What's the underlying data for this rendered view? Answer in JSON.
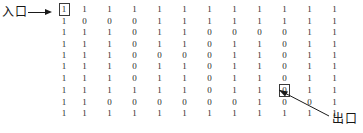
{
  "figure": {
    "type": "maze-matrix-diagram"
  },
  "annotations": {
    "entrance": {
      "label": "入口",
      "arrow": "arrow-right",
      "target_row": 1,
      "target_col": 1,
      "target_value": "1"
    },
    "exit": {
      "label": "出口",
      "arrow": "arrow-up-left",
      "target_row": 8,
      "target_col": 10,
      "target_value": "0"
    }
  },
  "matrix": {
    "rows": 10,
    "cols": 12,
    "marked_cells": [
      {
        "row": 0,
        "col": 0
      },
      {
        "row": 7,
        "col": 9
      }
    ],
    "values": [
      [
        "1",
        "1",
        "1",
        "1",
        "1",
        "1",
        "1",
        "1",
        "1",
        "1",
        "1",
        "1"
      ],
      [
        "1",
        "0",
        "0",
        "0",
        "1",
        "1",
        "1",
        "1",
        "1",
        "1",
        "1",
        "1"
      ],
      [
        "1",
        "1",
        "1",
        "0",
        "1",
        "1",
        "0",
        "0",
        "0",
        "0",
        "1",
        "1"
      ],
      [
        "1",
        "1",
        "1",
        "0",
        "1",
        "1",
        "0",
        "1",
        "1",
        "0",
        "1",
        "1"
      ],
      [
        "1",
        "1",
        "1",
        "0",
        "0",
        "0",
        "0",
        "1",
        "1",
        "0",
        "1",
        "1"
      ],
      [
        "1",
        "1",
        "1",
        "0",
        "1",
        "1",
        "0",
        "1",
        "1",
        "0",
        "1",
        "1"
      ],
      [
        "1",
        "1",
        "1",
        "0",
        "1",
        "1",
        "0",
        "1",
        "1",
        "0",
        "1",
        "1"
      ],
      [
        "1",
        "1",
        "1",
        "1",
        "1",
        "1",
        "0",
        "1",
        "1",
        "0",
        "1",
        "1"
      ],
      [
        "1",
        "1",
        "0",
        "0",
        "0",
        "0",
        "0",
        "0",
        "1",
        "0",
        "0",
        "1"
      ],
      [
        "1",
        "1",
        "1",
        "1",
        "1",
        "1",
        "1",
        "1",
        "1",
        "1",
        "1",
        "1"
      ]
    ]
  },
  "colors": {
    "ink": "#1a1a1a",
    "digit": "#2b2b2b",
    "background": "#ffffff",
    "box_border": "#3a3a3a"
  }
}
